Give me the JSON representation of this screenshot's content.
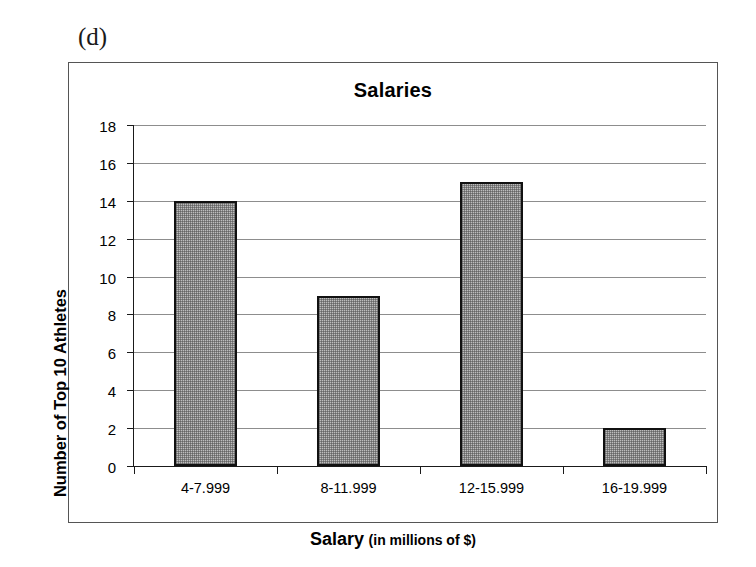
{
  "figure": {
    "panel_label": "(d)"
  },
  "chart_data": {
    "type": "bar",
    "title": "Salaries",
    "categories": [
      "4-7.999",
      "8-11.999",
      "12-15.999",
      "16-19.999"
    ],
    "values": [
      14,
      9,
      15,
      2
    ],
    "xlabel": "Salary (in millions of $)",
    "xlabel_main": "Salary",
    "xlabel_sub": "(in millions of $)",
    "ylabel": "Number of Top 10 Athletes",
    "ylim": [
      0,
      18
    ],
    "ytick_step": 2,
    "yticks": [
      0,
      2,
      4,
      6,
      8,
      10,
      12,
      14,
      16,
      18
    ],
    "ytick_labels": [
      "0",
      "2",
      "4",
      "6",
      "8",
      "10",
      "12",
      "14",
      "16",
      "18"
    ],
    "grid": "horizontal",
    "legend": "none",
    "bar_fill_color": "#bdbdbd",
    "bar_edge_color": "#111111",
    "gridline_color": "#8d8d8d",
    "axis_color": "#1a1a1a",
    "background_color": "#ffffff"
  }
}
